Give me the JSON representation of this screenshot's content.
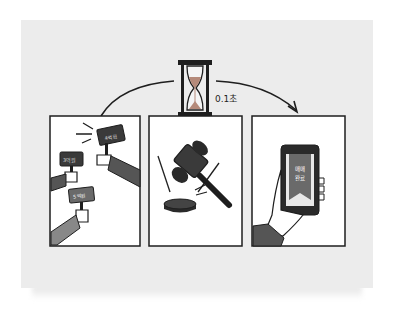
{
  "illustration": {
    "timer_label": "0.1초",
    "panels": [
      {
        "name": "bidding",
        "signs": [
          "4억원",
          "3억원",
          "5억원"
        ]
      },
      {
        "name": "gavel"
      },
      {
        "name": "phone",
        "screen_text": [
          "매매",
          "완료"
        ]
      }
    ],
    "colors": {
      "background": "#ececec",
      "panel": "#ffffff",
      "ink": "#1e1e1e",
      "accent": "#8a8a8a",
      "sand": "#b58a7a"
    }
  }
}
